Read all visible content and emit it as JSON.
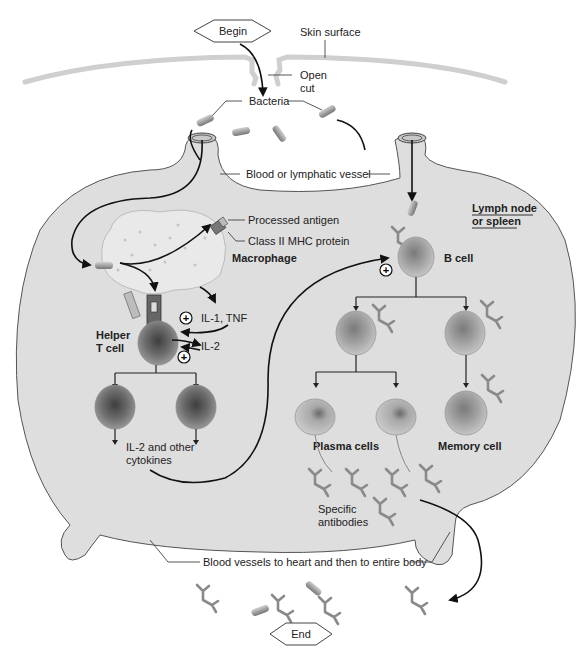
{
  "flow": {
    "begin": "Begin",
    "end": "End"
  },
  "labels": {
    "skin_surface": "Skin surface",
    "open_cut_1": "Open",
    "open_cut_2": "cut",
    "bacteria": "Bacteria",
    "vessel": "Blood or lymphatic vessel",
    "processed_antigen": "Processed antigen",
    "mhc": "Class II MHC protein",
    "macrophage": "Macrophage",
    "lymph_node_1": "Lymph node",
    "lymph_node_2": "or spleen",
    "b_cell": "B cell",
    "il1_tnf": "IL-1, TNF",
    "il2": "IL-2",
    "helper_1": "Helper",
    "helper_2": "T cell",
    "cytokines_1": "IL-2 and other",
    "cytokines_2": "cytokines",
    "plasma_cells": "Plasma cells",
    "memory_cell": "Memory cell",
    "antibodies_1": "Specific",
    "antibodies_2": "antibodies",
    "blood_vessels": "Blood vessels to heart and then to entire body"
  },
  "symbols": {
    "stimulate": "+"
  },
  "colors": {
    "node_fill": "#dedede",
    "node_stroke": "#555555",
    "skin": "#cfcfcf",
    "macrophage": "#e9e9e9",
    "cell_outer": "#b9b9b9",
    "cell_dark": "#6b6b6b",
    "antibody": "#8a8a8a"
  }
}
